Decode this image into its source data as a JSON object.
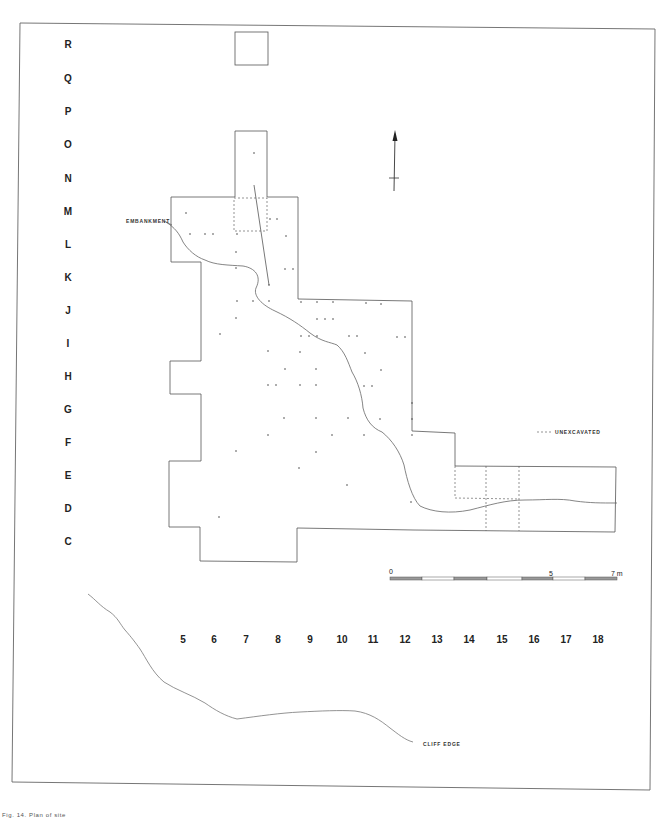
{
  "figure": {
    "caption": "Fig. 14. Plan of site",
    "north_arrow": "north-arrow-icon"
  },
  "grid": {
    "rows": [
      "R",
      "Q",
      "P",
      "O",
      "N",
      "M",
      "L",
      "K",
      "J",
      "I",
      "H",
      "G",
      "F",
      "E",
      "D",
      "C"
    ],
    "columns": [
      "5",
      "6",
      "7",
      "8",
      "9",
      "10",
      "11",
      "12",
      "13",
      "14",
      "15",
      "16",
      "17",
      "18"
    ]
  },
  "annotations": {
    "embankment": "EMBANKMENT",
    "cliff_edge": "CLIFF EDGE",
    "legend_unexcavated": "UNEXCAVATED"
  },
  "scale_bar": {
    "start": "0",
    "mid": "5",
    "end": "7 m"
  },
  "colors": {
    "line": "#555555",
    "text": "#222222",
    "frame": "#666666",
    "background": "#ffffff"
  }
}
